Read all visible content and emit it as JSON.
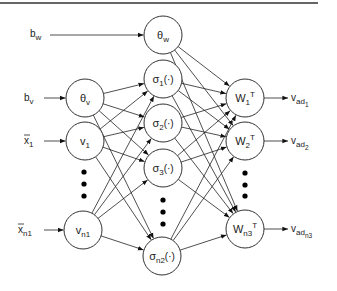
{
  "diagram": {
    "type": "neural-network",
    "top_rule": {
      "x1": 0,
      "x2": 318,
      "y": 3,
      "color": "#333333"
    },
    "colors": {
      "stroke": "#333333",
      "text": "#222222",
      "fill": "#ffffff",
      "dots": "#000000"
    },
    "node_radius": 19,
    "inputs": [
      {
        "id": "bw",
        "base": "b",
        "sub": "w",
        "overline": false,
        "x": 30,
        "y": 37,
        "target": "theta_w"
      },
      {
        "id": "bv",
        "base": "b",
        "sub": "v",
        "overline": false,
        "x": 24,
        "y": 101,
        "target": "theta_v"
      },
      {
        "id": "x1",
        "base": "x",
        "sub": "1",
        "overline": true,
        "x": 24,
        "y": 144,
        "target": "v1"
      },
      {
        "id": "xn1",
        "base": "x",
        "sub": "n1",
        "overline": true,
        "x": 18,
        "y": 233,
        "target": "vn1"
      }
    ],
    "layers": {
      "input_layer": [
        {
          "id": "theta_v",
          "base": "θ",
          "sub": "v",
          "suffix": "",
          "sup": "",
          "x": 85,
          "y": 98
        },
        {
          "id": "v1",
          "base": "v",
          "sub": "1",
          "suffix": "",
          "sup": "",
          "x": 85,
          "y": 141
        },
        {
          "id": "vn1",
          "base": "v",
          "sub": "n1",
          "suffix": "",
          "sup": "",
          "x": 83,
          "y": 230
        }
      ],
      "hidden_layer": [
        {
          "id": "theta_w",
          "base": "θ",
          "sub": "w",
          "suffix": "",
          "sup": "",
          "x": 163,
          "y": 35
        },
        {
          "id": "sigma1",
          "base": "σ",
          "sub": "1",
          "suffix": "(·)",
          "sup": "",
          "x": 163,
          "y": 79
        },
        {
          "id": "sigma2",
          "base": "σ",
          "sub": "2",
          "suffix": "(·)",
          "sup": "",
          "x": 163,
          "y": 123
        },
        {
          "id": "sigma3",
          "base": "σ",
          "sub": "3",
          "suffix": "(·)",
          "sup": "",
          "x": 163,
          "y": 168
        },
        {
          "id": "sigman2",
          "base": "σ",
          "sub": "n2",
          "suffix": "(·)",
          "sup": "",
          "x": 162,
          "y": 256
        }
      ],
      "output_layer": [
        {
          "id": "W1",
          "base": "W",
          "sub": "1",
          "suffix": "",
          "sup": "T",
          "x": 245,
          "y": 98
        },
        {
          "id": "W2",
          "base": "W",
          "sub": "2",
          "suffix": "",
          "sup": "T",
          "x": 245,
          "y": 141
        },
        {
          "id": "Wn3",
          "base": "W",
          "sub": "n3",
          "suffix": "",
          "sup": "T",
          "x": 245,
          "y": 229
        }
      ]
    },
    "outputs": [
      {
        "id": "vad1",
        "base": "v",
        "sub": "ad",
        "subsub": "1",
        "x": 291,
        "y": 101,
        "source": "W1"
      },
      {
        "id": "vad2",
        "base": "v",
        "sub": "ad",
        "subsub": "2",
        "x": 291,
        "y": 144,
        "source": "W2"
      },
      {
        "id": "vadn3",
        "base": "v",
        "sub": "ad",
        "subsub": "n3",
        "x": 291,
        "y": 232,
        "source": "Wn3"
      }
    ],
    "ellipses": [
      {
        "id": "input-ellipsis",
        "x": 84,
        "ys": [
          172,
          184,
          196
        ]
      },
      {
        "id": "hidden-ellipsis",
        "x": 163,
        "ys": [
          200,
          212,
          224
        ]
      },
      {
        "id": "output-ellipsis",
        "x": 245,
        "ys": [
          173,
          185,
          196
        ]
      }
    ],
    "connections": {
      "input_to_hidden": "full: every input_layer node → every sigma node (not theta_w)",
      "hidden_to_output": "full: every hidden_layer node (incl. theta_w) → every output_layer node"
    }
  }
}
